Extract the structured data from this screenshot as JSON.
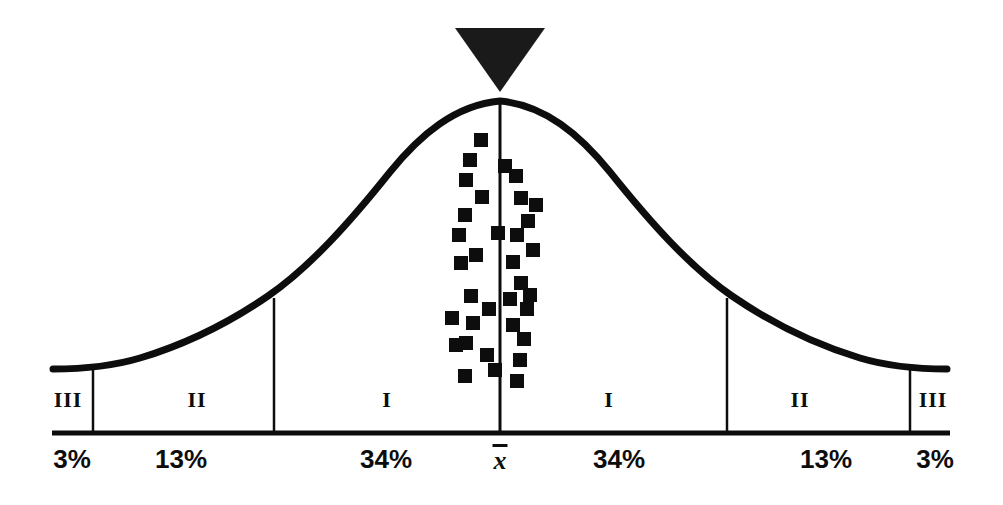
{
  "figure": {
    "kind": "normal-curve",
    "background_color": "#ffffff",
    "ink_color": "#0d0d0d"
  },
  "chart_data": {
    "type": "line",
    "title": "",
    "subtitle": "",
    "xlabel": "",
    "ylabel": "",
    "grid": false,
    "legend": null,
    "curve_name": "normal-distribution",
    "x": [
      -3.2,
      -3,
      -2.7,
      -2.4,
      -2.1,
      -1.8,
      -1.5,
      -1.2,
      -0.9,
      -0.6,
      -0.3,
      0,
      0.3,
      0.6,
      0.9,
      1.2,
      1.5,
      1.8,
      2.1,
      2.4,
      2.7,
      3,
      3.2
    ],
    "y": [
      0.0024,
      0.0044,
      0.0104,
      0.0224,
      0.044,
      0.079,
      0.1295,
      0.1942,
      0.2661,
      0.3332,
      0.3814,
      0.3989,
      0.3814,
      0.3332,
      0.2661,
      0.1942,
      0.1295,
      0.079,
      0.044,
      0.0224,
      0.0104,
      0.0044,
      0.0024
    ],
    "xlim": [
      -3.3,
      3.3
    ],
    "ylim": [
      0,
      0.42
    ],
    "bands": [
      {
        "id": "band-left-3",
        "roman": "III",
        "percent": "3%",
        "range_sd": [
          -3.0,
          -2.0
        ],
        "label_x_sd": -2.55,
        "pct_x_sd": -2.5
      },
      {
        "id": "band-left-2",
        "roman": "II",
        "percent": "13%",
        "range_sd": [
          -2.0,
          -1.0
        ],
        "label_x_sd": -1.5,
        "pct_x_sd": -1.45
      },
      {
        "id": "band-left-1",
        "roman": "I",
        "percent": "34%",
        "range_sd": [
          -1.0,
          0.0
        ],
        "label_x_sd": -0.5,
        "pct_x_sd": -0.51
      },
      {
        "id": "band-right-1",
        "roman": "I",
        "percent": "34%",
        "range_sd": [
          0.0,
          1.0
        ],
        "label_x_sd": 0.5,
        "pct_x_sd": 0.53
      },
      {
        "id": "band-right-2",
        "roman": "II",
        "percent": "13%",
        "range_sd": [
          1.0,
          2.0
        ],
        "label_x_sd": 1.5,
        "pct_x_sd": 1.49
      },
      {
        "id": "band-right-3",
        "roman": "III",
        "percent": "3%",
        "range_sd": [
          2.0,
          3.0
        ],
        "label_x_sd": 2.55,
        "pct_x_sd": 2.52
      }
    ],
    "mean_marker": {
      "label": "x̄",
      "glyph": "x",
      "description": "x-bar, sample mean",
      "x_sd": 0
    },
    "apex_marker": {
      "shape": "triangle-down",
      "name": "peak-pointer",
      "x_sd": 0,
      "filled": true
    },
    "score_markers": {
      "shape": "square",
      "count": 34,
      "size_px": 14,
      "points": [
        {
          "x": 481,
          "y": 140
        },
        {
          "x": 516,
          "y": 176
        },
        {
          "x": 466,
          "y": 180
        },
        {
          "x": 482,
          "y": 197
        },
        {
          "x": 521,
          "y": 198
        },
        {
          "x": 465,
          "y": 215
        },
        {
          "x": 528,
          "y": 221
        },
        {
          "x": 517,
          "y": 235
        },
        {
          "x": 476,
          "y": 255
        },
        {
          "x": 461,
          "y": 263
        },
        {
          "x": 513,
          "y": 262
        },
        {
          "x": 521,
          "y": 283
        },
        {
          "x": 471,
          "y": 296
        },
        {
          "x": 510,
          "y": 299
        },
        {
          "x": 527,
          "y": 309
        },
        {
          "x": 452,
          "y": 318
        },
        {
          "x": 473,
          "y": 323
        },
        {
          "x": 513,
          "y": 325
        },
        {
          "x": 466,
          "y": 343
        },
        {
          "x": 524,
          "y": 339
        },
        {
          "x": 487,
          "y": 355
        },
        {
          "x": 520,
          "y": 360
        },
        {
          "x": 465,
          "y": 376
        },
        {
          "x": 517,
          "y": 381
        },
        {
          "x": 489,
          "y": 309
        },
        {
          "x": 498,
          "y": 233
        },
        {
          "x": 459,
          "y": 235
        },
        {
          "x": 505,
          "y": 166
        },
        {
          "x": 533,
          "y": 250
        },
        {
          "x": 456,
          "y": 345
        },
        {
          "x": 495,
          "y": 370
        },
        {
          "x": 530,
          "y": 295
        },
        {
          "x": 470,
          "y": 160
        },
        {
          "x": 536,
          "y": 205
        }
      ]
    },
    "axis": {
      "baseline_y_px": 433,
      "baseline_x_start_px": 52,
      "baseline_x_end_px": 950,
      "divider_x_px": [
        93,
        274,
        500,
        727,
        910
      ],
      "divider_top_y_px": [
        368,
        302,
        100,
        302,
        368
      ]
    }
  }
}
